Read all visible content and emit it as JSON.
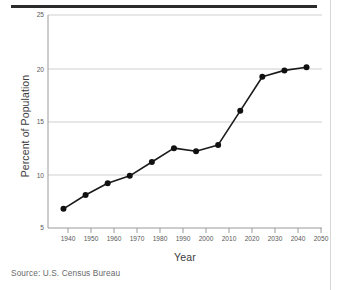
{
  "figure": {
    "source_note": "Source: U.S. Census Bureau",
    "rule_color": "#2b2b2b",
    "background": "#ffffff"
  },
  "chart_data": {
    "type": "line",
    "title": "",
    "subtitle": "",
    "xlabel": "Year",
    "ylabel": "Percent of Population",
    "x": [
      1940,
      1950,
      1960,
      1970,
      1980,
      1990,
      2000,
      2010,
      2020,
      2030,
      2040,
      2050
    ],
    "values": [
      6.8,
      8.1,
      9.2,
      9.9,
      11.2,
      12.5,
      12.2,
      12.8,
      16.0,
      19.2,
      19.8,
      20.1
    ],
    "series": [
      {
        "name": "Percent of Population",
        "values": [
          6.8,
          8.1,
          9.2,
          9.9,
          11.2,
          12.5,
          12.2,
          12.8,
          16.0,
          19.2,
          19.8,
          20.1
        ]
      }
    ],
    "xlim": [
      1933,
      2057
    ],
    "ylim": [
      5,
      25
    ],
    "xticks": [
      1940,
      1950,
      1960,
      1970,
      1980,
      1990,
      2000,
      2010,
      2020,
      2030,
      2040,
      2050
    ],
    "xtick_labels": [
      "1940",
      "1950",
      "1960",
      "1970",
      "1980",
      "1990",
      "2000",
      "2010",
      "2020",
      "2030",
      "2040",
      "2050"
    ],
    "yticks": [
      5,
      10,
      15,
      20,
      25
    ],
    "ytick_labels": [
      "5",
      "10",
      "15",
      "20",
      "25"
    ],
    "grid": "horizontal",
    "legend": "none",
    "line_color": "#1a1a1a",
    "marker": "circle",
    "marker_color": "#111111",
    "grid_color": "#cfcfcf",
    "annotations": []
  }
}
